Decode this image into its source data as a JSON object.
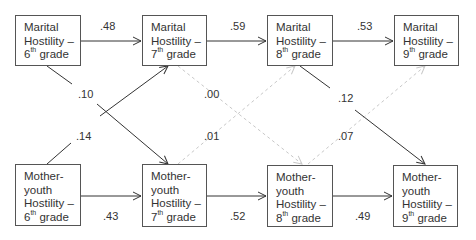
{
  "nodes": {
    "mh6": {
      "lines": [
        "Marital",
        "Hostility –"
      ],
      "grade_num": "6",
      "grade_sup": "th",
      "grade_word": " grade"
    },
    "mh7": {
      "lines": [
        "Marital",
        "Hostility –"
      ],
      "grade_num": "7",
      "grade_sup": "th",
      "grade_word": " grade"
    },
    "mh8": {
      "lines": [
        "Marital",
        "Hostility –"
      ],
      "grade_num": "8",
      "grade_sup": "th",
      "grade_word": " grade"
    },
    "mh9": {
      "lines": [
        "Marital",
        "Hostility –"
      ],
      "grade_num": "9",
      "grade_sup": "th",
      "grade_word": " grade"
    },
    "my6": {
      "lines": [
        "Mother-",
        "youth",
        "Hostility –"
      ],
      "grade_num": "6",
      "grade_sup": "th",
      "grade_word": " grade"
    },
    "my7": {
      "lines": [
        "Mother-",
        "youth",
        "Hostility –"
      ],
      "grade_num": "7",
      "grade_sup": "th",
      "grade_word": " grade"
    },
    "my8": {
      "lines": [
        "Mother-",
        "youth",
        "Hostility –"
      ],
      "grade_num": "8",
      "grade_sup": "th",
      "grade_word": " grade"
    },
    "my9": {
      "lines": [
        "Mother-",
        "youth",
        "Hostility –"
      ],
      "grade_num": "9",
      "grade_sup": "th",
      "grade_word": " grade"
    }
  },
  "paths": {
    "mh6_mh7": ".48",
    "mh7_mh8": ".59",
    "mh8_mh9": ".53",
    "my6_my7": ".43",
    "my7_my8": ".52",
    "my8_my9": ".49",
    "mh6_my7": ".10",
    "my6_mh7": ".14",
    "mh7_my8": ".00",
    "my7_mh8": ".01",
    "mh8_my9": ".12",
    "my8_mh9": ".07"
  },
  "colors": {
    "solid_line": "#333333",
    "dashed_line": "#c8c8c8",
    "box_border": "#555555"
  }
}
